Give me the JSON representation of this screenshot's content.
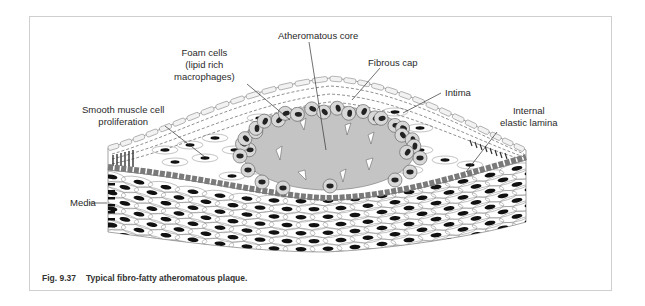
{
  "figure": {
    "caption_number": "Fig. 9.37",
    "caption_text": "Typical fibro-fatty atheromatous plaque.",
    "labels": [
      {
        "id": "atheromatous-core",
        "text": "Atheromatous core"
      },
      {
        "id": "foam-cells",
        "text": "Foam cells\n(lipid rich\nmacrophages)"
      },
      {
        "id": "fibrous-cap",
        "text": "Fibrous cap"
      },
      {
        "id": "intima",
        "text": "Intima"
      },
      {
        "id": "smooth-muscle",
        "text": "Smooth muscle cell\nproliferation"
      },
      {
        "id": "internal-elastic-lamina",
        "text": "Internal\nelastic lamina"
      },
      {
        "id": "media",
        "text": "Media"
      }
    ],
    "colors": {
      "core": "#c4c4c4",
      "elastic_lamina": "#7a7a7a",
      "nucleus": "#111111",
      "outline": "#555555",
      "frame": "#cfcfcf",
      "label": "#2a2a2a"
    }
  }
}
